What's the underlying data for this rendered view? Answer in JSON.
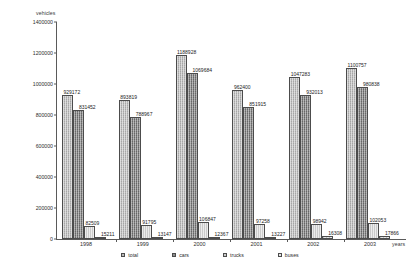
{
  "chart_data": {
    "type": "bar",
    "title": "",
    "ylabel": "vehicles",
    "xlabel": "years",
    "categories": [
      "1998",
      "1999",
      "2000",
      "2001",
      "2002",
      "2003"
    ],
    "ylim": [
      0,
      1400000
    ],
    "ytick_step": 200000,
    "yticks": [
      "0",
      "200000",
      "400000",
      "600000",
      "800000",
      "1000000",
      "1200000",
      "1400000"
    ],
    "grid": false,
    "legend_position": "bottom",
    "series": [
      {
        "name": "total",
        "color": "#b9b9b9",
        "values": [
          929172,
          893819,
          1188928,
          962400,
          1047283,
          1100757
        ],
        "labels": [
          "929172",
          "893819",
          "1188928",
          "962400",
          "1047283",
          "1100757"
        ]
      },
      {
        "name": "cars",
        "color": "#8f8f8f",
        "values": [
          831452,
          788967,
          1069684,
          851915,
          932013,
          980838
        ],
        "labels": [
          "831452",
          "788967",
          "1069684",
          "851915",
          "932013",
          "980838"
        ]
      },
      {
        "name": "trucks",
        "color": "#cacaca",
        "values": [
          82509,
          91795,
          106847,
          97258,
          98942,
          102053
        ],
        "labels": [
          "82509",
          "91795",
          "106847",
          "97258",
          "98942",
          "102053"
        ]
      },
      {
        "name": "buses",
        "color": "#e6e6e6",
        "values": [
          15211,
          13147,
          12367,
          13227,
          16308,
          17866
        ],
        "labels": [
          "15211",
          "13147",
          "12367",
          "13227",
          "16308",
          "17866"
        ]
      }
    ]
  },
  "legend": {
    "items": [
      {
        "label": "total"
      },
      {
        "label": "cars"
      },
      {
        "label": "trucks"
      },
      {
        "label": "buses"
      }
    ]
  }
}
